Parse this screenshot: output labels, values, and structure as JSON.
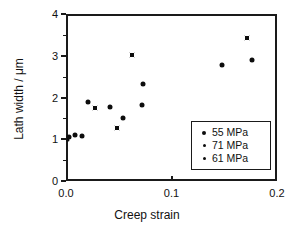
{
  "chart_data": {
    "type": "scatter",
    "title": "",
    "xlabel": "Creep strain",
    "ylabel": "Lath width / μm",
    "xlim": [
      0.0,
      0.2
    ],
    "ylim": [
      0,
      4
    ],
    "xticks": [
      "0.0",
      "0.1",
      "0.2"
    ],
    "xtick_values": [
      0.0,
      0.1,
      0.2
    ],
    "yticks": [
      "0",
      "1",
      "2",
      "3",
      "4"
    ],
    "ytick_values": [
      0,
      1,
      2,
      3,
      4
    ],
    "grid": false,
    "legend_position": "lower-right",
    "series": [
      {
        "name": "55 MPa",
        "marker": "filled-circle",
        "points": [
          {
            "x": 0.001,
            "y": 1.1
          },
          {
            "x": 0.007,
            "y": 1.14
          },
          {
            "x": 0.013,
            "y": 1.13
          },
          {
            "x": 0.019,
            "y": 1.95
          },
          {
            "x": 0.04,
            "y": 1.83
          },
          {
            "x": 0.052,
            "y": 1.56
          },
          {
            "x": 0.071,
            "y": 2.38
          },
          {
            "x": 0.07,
            "y": 1.87
          },
          {
            "x": 0.146,
            "y": 2.82
          },
          {
            "x": 0.174,
            "y": 2.94
          }
        ]
      },
      {
        "name": "71 MPa",
        "marker": "small-dot",
        "points": [
          {
            "x": 0.0,
            "y": 1.03
          }
        ]
      },
      {
        "name": "61 MPa",
        "marker": "square",
        "points": [
          {
            "x": 0.026,
            "y": 1.79
          },
          {
            "x": 0.046,
            "y": 1.31
          },
          {
            "x": 0.061,
            "y": 3.06
          },
          {
            "x": 0.17,
            "y": 3.48
          }
        ]
      }
    ]
  },
  "legend": {
    "entries": [
      {
        "label": "55 MPa",
        "marker": "filled-circle"
      },
      {
        "label": "71 MPa",
        "marker": "small-dot"
      },
      {
        "label": "61 MPa",
        "marker": "square"
      }
    ]
  },
  "colors": {
    "marker": "#0d0d0d",
    "axis": "#1a1a1a",
    "background": "#ffffff"
  }
}
